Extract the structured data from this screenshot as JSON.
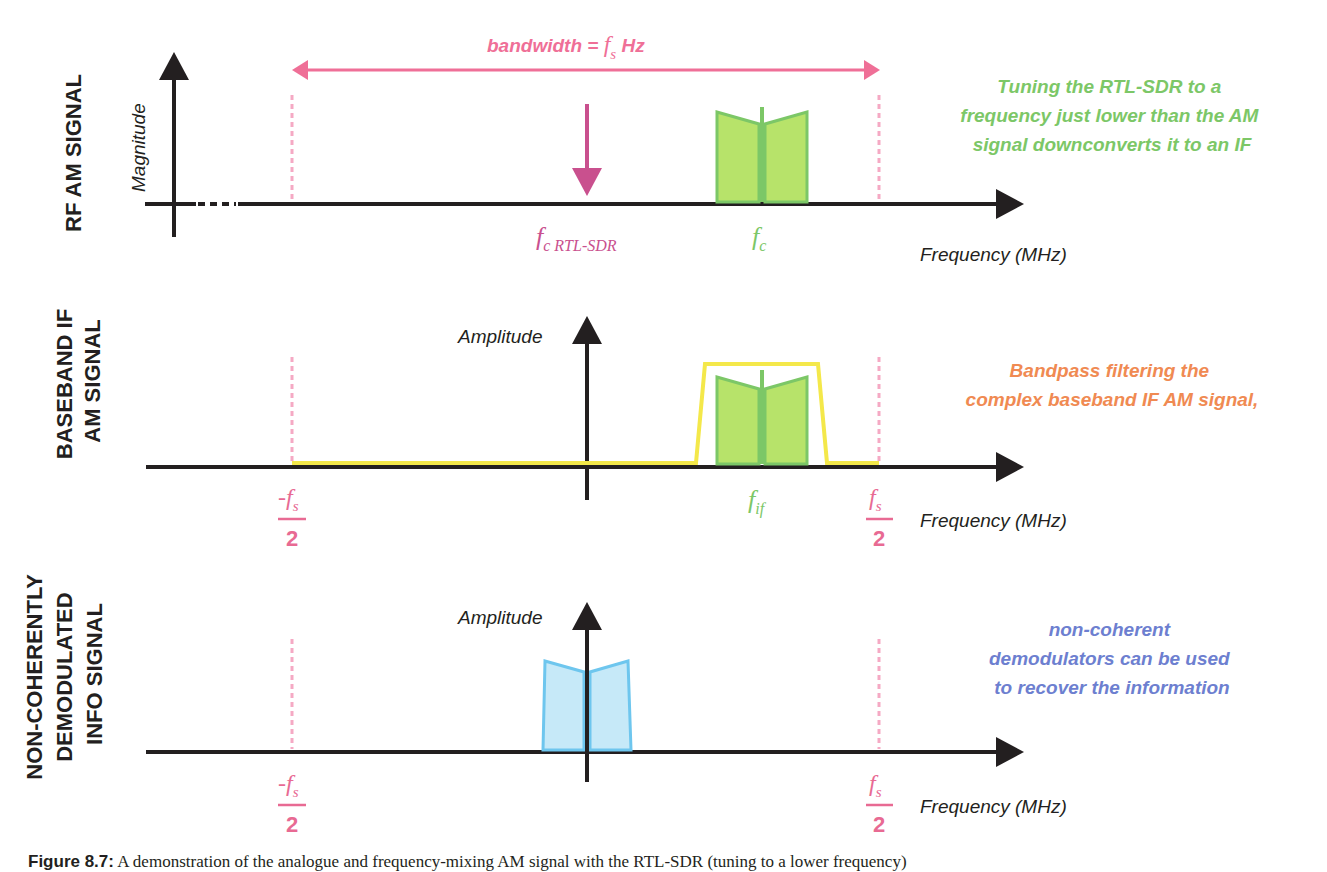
{
  "colors": {
    "axis": "#231f20",
    "pink": "#ef6f97",
    "pink_dash": "#f5a9c4",
    "magenta": "#c9508e",
    "green_fill": "#b7e36a",
    "green_stroke": "#7cc767",
    "green_text": "#7cc767",
    "yellow": "#f4e84a",
    "blue_fill": "#c6e9f8",
    "blue_stroke": "#6ec6ee",
    "orange_text": "#f08a52",
    "blue_text": "#6d7fd0"
  },
  "panels": [
    {
      "row_label": "RF AM SIGNAL",
      "y_axis_label": "Magnitude",
      "x_axis_label": "Frequency (MHz)",
      "bandwidth_label": "bandwidth = ",
      "bandwidth_fs": "f",
      "bandwidth_fs_sub": "s",
      "bandwidth_unit": " Hz",
      "tuning_marker_label": "f",
      "tuning_marker_sub": "c RTL-SDR",
      "carrier_label": "f",
      "carrier_sub": "c",
      "note_lines": [
        "Tuning the RTL-SDR to a",
        "frequency just lower than the AM",
        "signal downconverts it to an IF"
      ]
    },
    {
      "row_label_lines": [
        "BASEBAND IF",
        "AM SIGNAL"
      ],
      "y_axis_label": "Amplitude",
      "x_axis_label": "Frequency (MHz)",
      "left_edge_num": "-f",
      "left_edge_sub": "s",
      "left_edge_den": "2",
      "right_edge_num": "f",
      "right_edge_sub": "s",
      "right_edge_den": "2",
      "if_label": "f",
      "if_sub": "if",
      "note_lines": [
        "Bandpass filtering the",
        "complex baseband IF AM signal,"
      ]
    },
    {
      "row_label_lines": [
        "NON-COHERENTLY",
        "DEMODULATED",
        "INFO  SIGNAL"
      ],
      "y_axis_label": "Amplitude",
      "x_axis_label": "Frequency (MHz)",
      "left_edge_num": "-f",
      "left_edge_sub": "s",
      "left_edge_den": "2",
      "right_edge_num": "f",
      "right_edge_sub": "s",
      "right_edge_den": "2",
      "note_lines": [
        "non-coherent",
        "demodulators can be used",
        "to recover the information"
      ]
    }
  ],
  "caption": {
    "label": "Figure 8.7:",
    "text": " A demonstration of the analogue and frequency-mixing AM signal with the RTL-SDR (tuning to a lower frequency)"
  }
}
